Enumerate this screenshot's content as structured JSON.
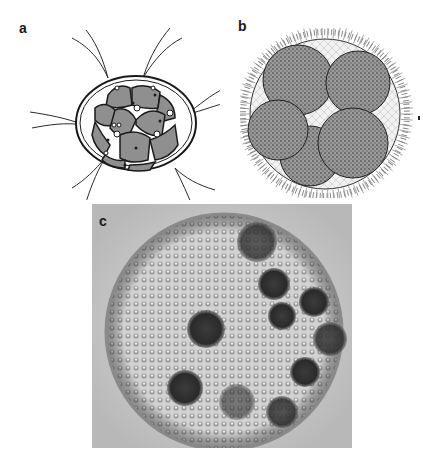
{
  "figure": {
    "panels": [
      {
        "id": "a",
        "label": "a",
        "content": "line drawing of 16-cell colony in gelatinous envelope with flagella"
      },
      {
        "id": "b",
        "label": "b",
        "content": "stippled drawing of spherical colony with cilia-like flagella and daughter colonies"
      },
      {
        "id": "c",
        "label": "c",
        "content": "light micrograph of spheroid colony with many small somatic cells and dark daughter colonies"
      }
    ]
  },
  "colors": {
    "background": "#ffffff",
    "ink": "#1a1a1a",
    "cell_fill": "#8f8f8f",
    "micrograph_bg": "#c8c8c8",
    "micrograph_inner": "#d8d8d8"
  }
}
